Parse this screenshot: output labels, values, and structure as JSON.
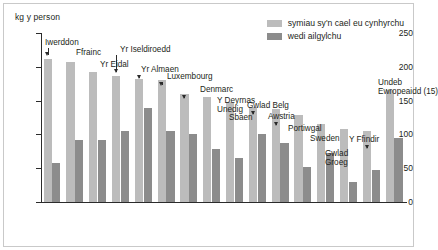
{
  "axis": {
    "y_unit_label": "kg y person",
    "y_ticks": [
      "250",
      "200",
      "150",
      "100",
      "50",
      "0"
    ]
  },
  "legend": {
    "items": [
      {
        "label": "symiau sy'n cael eu cynhyrchu",
        "color": "#bcbcbc",
        "swatch": "light-swatch"
      },
      {
        "label": "wedi ailgylchu",
        "color": "#8c8c8c",
        "swatch": "dark-swatch"
      }
    ]
  },
  "chart_data": {
    "type": "bar",
    "title": "",
    "xlabel": "",
    "ylabel": "kg y person",
    "ylim": [
      0,
      250
    ],
    "grid": false,
    "legend_position": "top-right",
    "categories": [
      "Iwerddon",
      "Ffrainc",
      "Yr Eidal",
      "Yr Iseldiroedd",
      "Yr Almaen",
      "Luxembourg",
      "Denmarc",
      "Y Deyrnas Unedig",
      "Sbaen",
      "Gwlad Belg",
      "Awstria",
      "Portiwgal",
      "Sweden",
      "Gwlad Groeg",
      "Y Ffindir",
      "Undeb Ewropeaidd (15)"
    ],
    "series": [
      {
        "name": "symiau sy'n cael eu cynhyrchu",
        "color": "#bcbcbc",
        "values": [
          212,
          207,
          193,
          186,
          182,
          180,
          160,
          156,
          148,
          140,
          137,
          128,
          116,
          108,
          105,
          165
        ]
      },
      {
        "name": "wedi ailgylchu",
        "color": "#8c8c8c",
        "values": [
          58,
          92,
          92,
          105,
          139,
          105,
          100,
          79,
          65,
          100,
          88,
          52,
          73,
          30,
          47,
          95
        ]
      }
    ],
    "annotations": [
      {
        "label": "Iwerddon",
        "category_index": 0,
        "has_arrow": true
      },
      {
        "label": "Ffrainc",
        "category_index": 1,
        "has_arrow": false
      },
      {
        "label": "Yr Eidal",
        "category_index": 2,
        "has_arrow": false
      },
      {
        "label": "Yr Iseldiroedd",
        "category_index": 3,
        "has_arrow": true
      },
      {
        "label": "Yr Almaen",
        "category_index": 4,
        "has_arrow": true
      },
      {
        "label": "Luxembourg",
        "category_index": 5,
        "has_arrow": true
      },
      {
        "label": "Denmarc",
        "category_index": 6,
        "has_arrow": true
      },
      {
        "label": "Y Deyrnas\nUnedig",
        "category_index": 7,
        "has_arrow": false
      },
      {
        "label": "Sbaen",
        "category_index": 8,
        "has_arrow": false
      },
      {
        "label": "Gwlad Belg",
        "category_index": 9,
        "has_arrow": true
      },
      {
        "label": "Awstria",
        "category_index": 10,
        "has_arrow": true
      },
      {
        "label": "Portiwgal",
        "category_index": 11,
        "has_arrow": false
      },
      {
        "label": "Sweden",
        "category_index": 12,
        "has_arrow": false
      },
      {
        "label": "Gwlad\nGroeg",
        "category_index": 13,
        "has_arrow": false
      },
      {
        "label": "Y Ffindir",
        "category_index": 14,
        "has_arrow": true
      },
      {
        "label": "Undeb\nEwropeaidd (15)",
        "category_index": 15,
        "has_arrow": false
      }
    ]
  }
}
